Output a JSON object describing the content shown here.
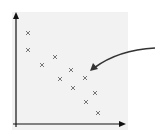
{
  "figure": {
    "type": "scatter",
    "panel_color": "#f2f2f2",
    "axis_color": "#111111",
    "marker_color": "#777777",
    "arrow_color": "#333333",
    "marker": "x"
  },
  "chart_data": {
    "type": "scatter",
    "title": "",
    "xlabel": "",
    "ylabel": "",
    "grid": false,
    "legend": null,
    "points_px": [
      [
        28,
        33
      ],
      [
        28,
        50
      ],
      [
        42,
        65
      ],
      [
        55,
        57
      ],
      [
        60,
        79
      ],
      [
        71,
        70
      ],
      [
        73,
        88
      ],
      [
        85,
        78
      ],
      [
        95,
        93
      ],
      [
        86,
        102
      ],
      [
        98,
        113
      ]
    ],
    "annotation": "curved arrow pointing at a data point from the right"
  }
}
